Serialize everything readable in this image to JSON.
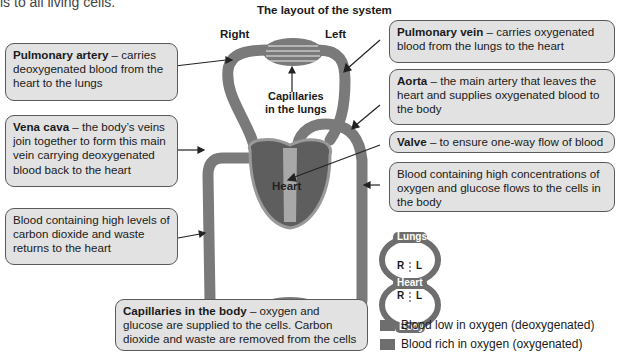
{
  "intro_fragment": "ls to all living cells.",
  "title": "The layout of the system",
  "labels": {
    "right": "Right",
    "left": "Left",
    "capillaries_lungs_1": "Capillaries",
    "capillaries_lungs_2": "in the lungs",
    "heart": "Heart",
    "artery_top": "Artery",
    "vein_top": "Vein",
    "vein_left": "Vein",
    "artery_right": "Artery"
  },
  "callouts": {
    "pulmonary_artery": {
      "term": "Pulmonary artery",
      "text": " – carries deoxygenated blood from the heart to the lungs"
    },
    "vena_cava": {
      "term": "Vena cava",
      "text": " – the body’s veins join together to form this main vein carrying deoxygenated blood back to the heart"
    },
    "co2_return": {
      "term": "",
      "text": "Blood containing high levels of carbon dioxide and waste returns to the heart"
    },
    "pulmonary_vein": {
      "term": "Pulmonary vein",
      "text": " – carries oxygenated blood from the lungs to the heart"
    },
    "aorta": {
      "term": "Aorta",
      "text": " – the main artery that leaves the heart and supplies oxygenated blood to the body"
    },
    "valve": {
      "term": "Valve",
      "text": " – to ensure one-way flow of blood"
    },
    "oxygen_flow": {
      "term": "",
      "text": "Blood containing high concentrations of oxygen and glucose flows to the cells in the body"
    },
    "capillaries_body": {
      "term": "Capillaries in the body",
      "text": " – oxygen and glucose are supplied to the cells. Carbon dioxide and waste are removed from the cells"
    }
  },
  "mini_diagram": {
    "lungs": "Lungs",
    "heart": "Heart",
    "body": "Body",
    "r": "R",
    "l": "L"
  },
  "legend": [
    {
      "label": "Blood low in oxygen (deoxygenated)",
      "color": "#6e6e6e"
    },
    {
      "label": "Blood rich in oxygen (oxygenated)",
      "color": "#6e6e6e"
    }
  ]
}
